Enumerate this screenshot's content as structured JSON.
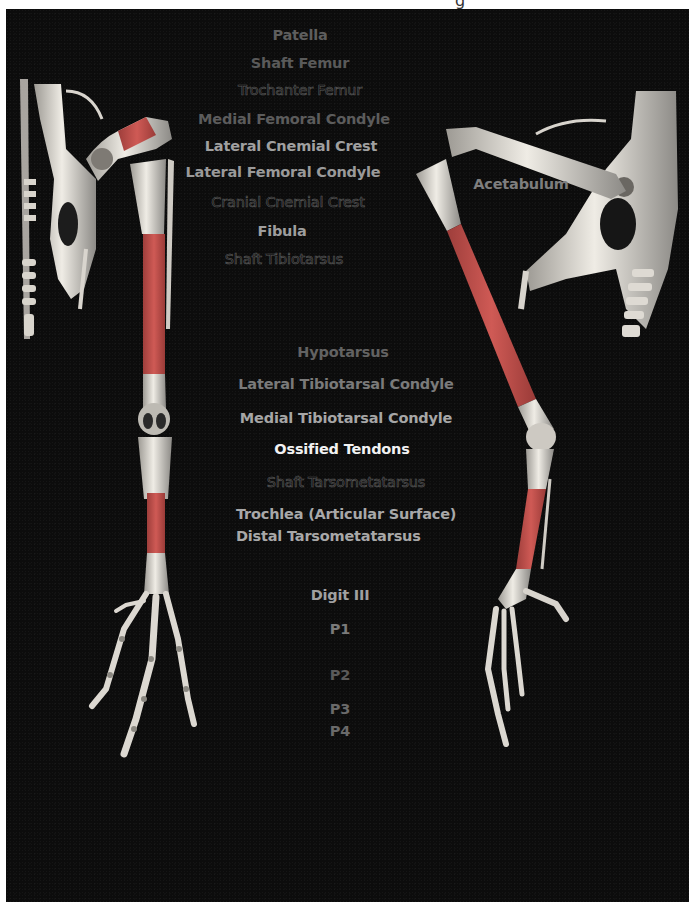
{
  "colors": {
    "background": "#0c0c0c",
    "page": "#ffffff",
    "shaft_highlight": "#c0524e",
    "bone": "#e6e3dc",
    "label_bright": "#f2f2f2",
    "label_mid": "#9a9a9a",
    "label_dim": "#5e5e5e"
  },
  "labels": [
    {
      "id": "patella",
      "text": "Patella",
      "x": 300,
      "y": 27,
      "style": "dim"
    },
    {
      "id": "shaft-femur",
      "text": "Shaft Femur",
      "x": 300,
      "y": 55,
      "style": "dim"
    },
    {
      "id": "trochanter-femur",
      "text": "Trochanter Femur",
      "x": 300,
      "y": 82,
      "style": "outline"
    },
    {
      "id": "medial-femoral-condyle",
      "text": "Medial Femoral Condyle",
      "x": 294,
      "y": 111,
      "style": "dim"
    },
    {
      "id": "lateral-cnemial-crest",
      "text": "Lateral Cnemial Crest",
      "x": 291,
      "y": 138,
      "style": "mid"
    },
    {
      "id": "lateral-femoral-condyle",
      "text": "Lateral Femoral Condyle",
      "x": 283,
      "y": 164,
      "style": "mid"
    },
    {
      "id": "cranial-cnemial-crest",
      "text": "Cranial Cnemial Crest",
      "x": 288,
      "y": 194,
      "style": "outline"
    },
    {
      "id": "fibula",
      "text": "Fibula",
      "x": 282,
      "y": 223,
      "style": "mid"
    },
    {
      "id": "shaft-tibiotarsus",
      "text": "Shaft Tibiotarsus",
      "x": 284,
      "y": 251,
      "style": "outline"
    },
    {
      "id": "hypotarsus",
      "text": "Hypotarsus",
      "x": 343,
      "y": 344,
      "style": "dim"
    },
    {
      "id": "lateral-tibiotarsal-condyle",
      "text": "Lateral Tibiotarsal Condyle",
      "x": 346,
      "y": 376,
      "style": "dim"
    },
    {
      "id": "medial-tibiotarsal-condyle",
      "text": "Medial Tibiotarsal Condyle",
      "x": 346,
      "y": 410,
      "style": "mid"
    },
    {
      "id": "ossified-tendons",
      "text": "Ossified Tendons",
      "x": 342,
      "y": 441,
      "style": "bright"
    },
    {
      "id": "shaft-tarsometatarsus",
      "text": "Shaft Tarsometatarsus",
      "x": 346,
      "y": 474,
      "style": "outline"
    },
    {
      "id": "trochlea",
      "text": "Trochlea (Articular Surface)",
      "x": 236,
      "y": 506,
      "style": "mid",
      "align": "left"
    },
    {
      "id": "distal-tarsometatarsus",
      "text": "Distal Tarsometatarsus",
      "x": 236,
      "y": 528,
      "style": "mid",
      "align": "left"
    },
    {
      "id": "digit-iii",
      "text": "Digit III",
      "x": 340,
      "y": 587,
      "style": "mid"
    },
    {
      "id": "p1",
      "text": "P1",
      "x": 340,
      "y": 621,
      "style": "dim"
    },
    {
      "id": "p2",
      "text": "P2",
      "x": 340,
      "y": 667,
      "style": "dim"
    },
    {
      "id": "p3",
      "text": "P3",
      "x": 340,
      "y": 701,
      "style": "dim"
    },
    {
      "id": "p4",
      "text": "P4",
      "x": 340,
      "y": 723,
      "style": "dim"
    },
    {
      "id": "acetabulum",
      "text": "Acetabulum",
      "x": 521,
      "y": 176,
      "style": "dim"
    }
  ],
  "figures": {
    "left": "cranial view of bird pelvis and hindlimb skeleton",
    "right": "lateral view of bird pelvis and hindlimb skeleton"
  },
  "top_glyph": "g"
}
